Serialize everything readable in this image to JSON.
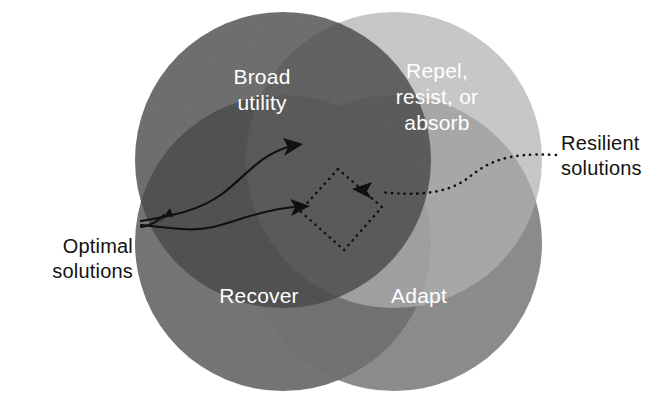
{
  "figure": {
    "type": "four-set-venn-diagram",
    "background_color": "#ffffff",
    "width": 664,
    "height": 400
  },
  "circles": [
    {
      "id": "broad-utility",
      "label_line1": "Broad",
      "label_line2": "utility",
      "position": "top-left",
      "color": "#4a4a4a",
      "cx": 283,
      "cy": 160,
      "r": 148
    },
    {
      "id": "repel-resist-absorb",
      "label_line1": "Repel,",
      "label_line2": "resist, or",
      "label_line3": "absorb",
      "position": "top-right",
      "color": "#b4b4b4",
      "cx": 394,
      "cy": 160,
      "r": 148
    },
    {
      "id": "recover",
      "label_line1": "Recover",
      "position": "bottom-left",
      "color": "#636363",
      "cx": 283,
      "cy": 243,
      "r": 148
    },
    {
      "id": "adapt",
      "label_line1": "Adapt",
      "position": "bottom-right",
      "color": "#747474",
      "cx": 394,
      "cy": 243,
      "r": 148
    }
  ],
  "callouts": [
    {
      "id": "optimal-solutions",
      "line1": "Optimal",
      "line2": "solutions",
      "side": "left",
      "connector_style": "solid-curved-arrows",
      "arrow_count": 2,
      "text_color": "#131313"
    },
    {
      "id": "resilient-solutions",
      "line1": "Resilient",
      "line2": "solutions",
      "side": "right",
      "connector_style": "dotted-arrow",
      "arrow_count": 1,
      "text_color": "#131313"
    }
  ],
  "highlight_region": {
    "id": "central-intersection",
    "style": "dotted-quadrilateral",
    "stroke_color": "#101010"
  }
}
